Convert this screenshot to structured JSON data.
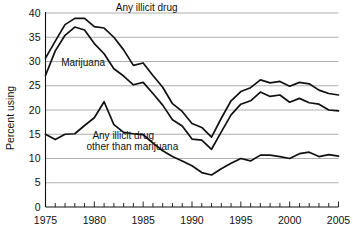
{
  "chart_data": {
    "type": "line",
    "title": "",
    "xlabel": "",
    "ylabel": "Percent using",
    "xlim": [
      1975,
      2005
    ],
    "ylim": [
      0,
      40
    ],
    "ytick_values": [
      0,
      5,
      10,
      15,
      20,
      25,
      30,
      35,
      40
    ],
    "ytick_labels": [
      "0",
      "5",
      "10",
      "15",
      "20",
      "25",
      "30",
      "35",
      "40"
    ],
    "xtick_values": [
      1975,
      1980,
      1985,
      1990,
      1995,
      2000,
      2005
    ],
    "xtick_labels": [
      "1975",
      "1980",
      "1985",
      "1990",
      "1995",
      "2000",
      "2005"
    ],
    "xtick_minor_step": 1,
    "grid": "horizontal",
    "legend": "inline-annotations",
    "x": [
      1975,
      1976,
      1977,
      1978,
      1979,
      1980,
      1981,
      1982,
      1983,
      1984,
      1985,
      1986,
      1987,
      1988,
      1989,
      1990,
      1991,
      1992,
      1993,
      1994,
      1995,
      1996,
      1997,
      1998,
      1999,
      2000,
      2001,
      2002,
      2003,
      2004,
      2005
    ],
    "series": [
      {
        "name": "Any illicit drug",
        "label": "Any illicit drug",
        "color": "#111111",
        "values": [
          30.7,
          34.2,
          37.6,
          38.9,
          38.9,
          37.2,
          36.9,
          35.0,
          32.4,
          29.2,
          29.7,
          27.1,
          24.7,
          21.3,
          19.7,
          17.2,
          16.4,
          14.4,
          18.3,
          21.9,
          23.8,
          24.6,
          26.2,
          25.6,
          25.9,
          24.9,
          25.7,
          25.4,
          24.1,
          23.4,
          23.1
        ],
        "annotation": {
          "x": 1982.2,
          "y": 40.5
        }
      },
      {
        "name": "Marijuana",
        "label": "Marijuana",
        "color": "#111111",
        "values": [
          27.1,
          32.2,
          35.4,
          37.1,
          36.5,
          33.7,
          31.6,
          28.5,
          27.0,
          25.2,
          25.7,
          23.4,
          21.0,
          18.0,
          16.7,
          14.0,
          13.8,
          11.9,
          15.5,
          19.0,
          21.2,
          21.9,
          23.7,
          22.8,
          23.1,
          21.6,
          22.4,
          21.5,
          21.2,
          20.0,
          19.8
        ],
        "annotation": {
          "x": 1976.6,
          "y": 29.0
        }
      },
      {
        "name": "Any illicit drug other than marijuana",
        "label_line1": "Any illicit drug",
        "label_line2": "other than marijuana",
        "color": "#111111",
        "values": [
          15.0,
          13.9,
          15.0,
          15.1,
          16.8,
          18.4,
          21.7,
          17.0,
          15.4,
          15.1,
          14.9,
          13.2,
          11.6,
          10.4,
          9.5,
          8.5,
          7.1,
          6.6,
          7.9,
          9.0,
          10.0,
          9.5,
          10.7,
          10.7,
          10.4,
          10.0,
          11.0,
          11.3,
          10.4,
          10.8,
          10.5
        ],
        "annotation_line1": {
          "x": 1979.8,
          "y": 14.0
        },
        "annotation_line2": {
          "x": 1979.2,
          "y": 11.8
        }
      }
    ]
  },
  "axes": {
    "y_axis_title": "Percent using"
  }
}
